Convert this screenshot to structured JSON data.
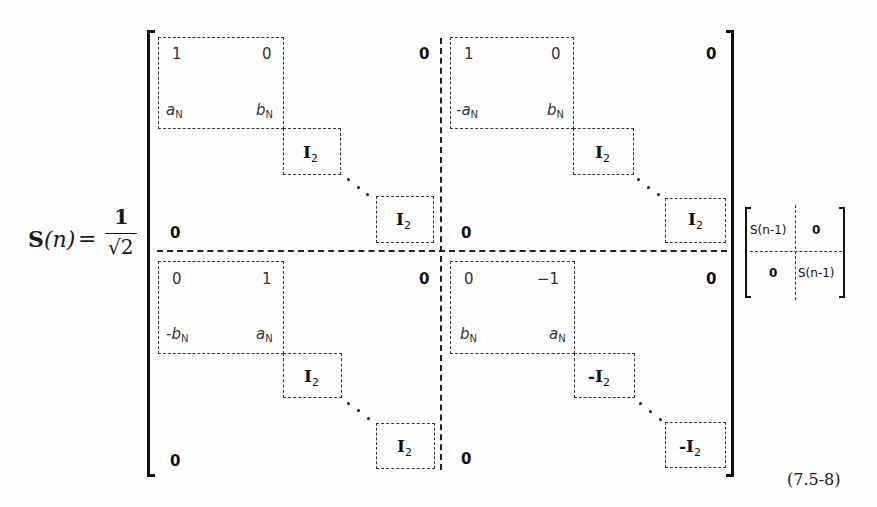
{
  "equation": {
    "lhs": {
      "symbol": "S",
      "arg": "(n)",
      "equals": "=",
      "fraction_num": "1",
      "fraction_den": "√2"
    },
    "big_matrix": {
      "top_left": {
        "block": {
          "r1c1": "1",
          "r1c2": "0",
          "r2c1": "a",
          "r2c1_sub": "N",
          "r2c2": "b",
          "r2c2_sub": "N"
        },
        "ident1": "I",
        "ident1_sub": "2",
        "ident2": "I",
        "ident2_sub": "2",
        "zero_upper": "0",
        "zero_lower": "0"
      },
      "top_right": {
        "block": {
          "r1c1": "1",
          "r1c2": "0",
          "r2c1": "-a",
          "r2c1_sub": "N",
          "r2c2": "b",
          "r2c2_sub": "N"
        },
        "ident1": "I",
        "ident1_sub": "2",
        "ident2": "I",
        "ident2_sub": "2",
        "zero_upper": "0",
        "zero_lower": "0"
      },
      "bottom_left": {
        "block": {
          "r1c1": "0",
          "r1c2": "1",
          "r2c1": "-b",
          "r2c1_sub": "N",
          "r2c2": "a",
          "r2c2_sub": "N"
        },
        "ident1": "I",
        "ident1_sub": "2",
        "ident2": "I",
        "ident2_sub": "2",
        "zero_upper": "0",
        "zero_lower": "0"
      },
      "bottom_right": {
        "block": {
          "r1c1": "0",
          "r1c2": "−1",
          "r2c1": "b",
          "r2c1_sub": "N",
          "r2c2": "a",
          "r2c2_sub": "N"
        },
        "ident1": "-I",
        "ident1_sub": "2",
        "ident2": "-I",
        "ident2_sub": "2",
        "zero_upper": "0",
        "zero_lower": "0"
      }
    },
    "small_matrix": {
      "r1c1": "S(n-1)",
      "r1c2": "0",
      "r2c1": "0",
      "r2c2": "S(n-1)"
    },
    "number": "(7.5-8)"
  }
}
